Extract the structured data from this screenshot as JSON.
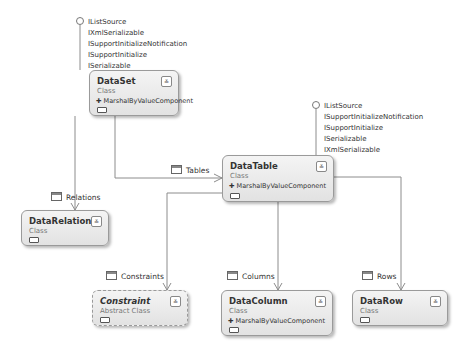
{
  "diagram": {
    "type": "class-diagram",
    "classes": [
      {
        "name": "DataSet",
        "stereotype": "Class",
        "base": "MarshalByValueComponent"
      },
      {
        "name": "DataTable",
        "stereotype": "Class",
        "base": "MarshalByValueComponent"
      },
      {
        "name": "DataRelation",
        "stereotype": "Class",
        "base": ""
      },
      {
        "name": "Constraint",
        "stereotype": "Abstract Class",
        "base": ""
      },
      {
        "name": "DataColumn",
        "stereotype": "Class",
        "base": "MarshalByValueComponent"
      },
      {
        "name": "DataRow",
        "stereotype": "Class",
        "base": ""
      }
    ],
    "interfaces": {
      "dataset": [
        "IListSource",
        "IXmlSerializable",
        "ISupportInitializeNotification",
        "ISupportInitialize",
        "ISerializable"
      ],
      "datatable": [
        "IListSource",
        "ISupportInitializeNotification",
        "ISupportInitialize",
        "ISerializable",
        "IXmlSerializable"
      ]
    },
    "associations": [
      {
        "label": "Tables",
        "from": "DataSet",
        "to": "DataTable"
      },
      {
        "label": "Relations",
        "from": "DataSet",
        "to": "DataRelation"
      },
      {
        "label": "Constraints",
        "from": "DataTable",
        "to": "Constraint"
      },
      {
        "label": "Columns",
        "from": "DataTable",
        "to": "DataColumn"
      },
      {
        "label": "Rows",
        "from": "DataTable",
        "to": "DataRow"
      }
    ],
    "expand_glyph": "≚",
    "base_arrow": "✚"
  }
}
